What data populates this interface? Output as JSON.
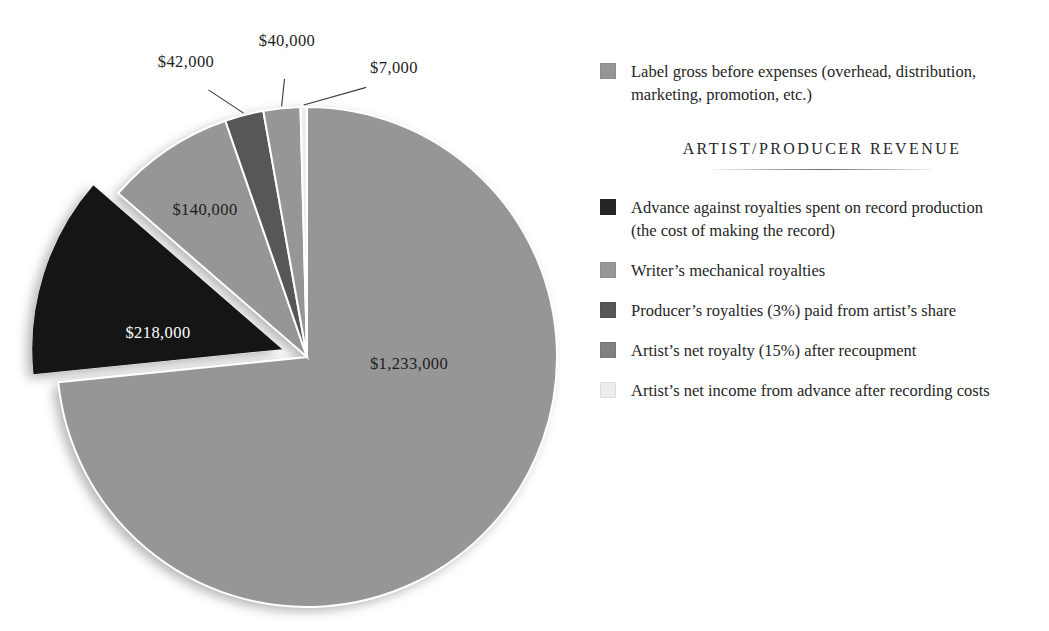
{
  "chart_data": {
    "type": "pie",
    "title": "",
    "currency": "$",
    "total": 1680000,
    "legend_position": "right",
    "categories": [
      "Label gross before expenses (overhead, distribution, marketing, promotion, etc.)",
      "Advance against royalties spent on record production (the cost of making the record)",
      "Writer's mechanical royalties",
      "Producer's royalties (3%) paid from artist's share",
      "Artist's net royalty (15%) after recoupment",
      "Artist's net income from advance after recording costs"
    ],
    "values": [
      1233000,
      218000,
      140000,
      42000,
      40000,
      7000
    ],
    "labels": [
      "$1,233,000",
      "$218,000",
      "$140,000",
      "$42,000",
      "$40,000",
      "$7,000"
    ],
    "colors": [
      "#969696",
      "#151515",
      "#969696",
      "#575757",
      "#969696",
      "#ededed"
    ]
  },
  "slices": [
    {
      "name": "label-gross",
      "value": 1233000,
      "label": "$1,233,000",
      "color": "#969696",
      "label_x": 409,
      "label_y": 364,
      "label_tone": "dark",
      "exploded": false,
      "leader": false
    },
    {
      "name": "advance-against-royalties",
      "value": 218000,
      "label": "$218,000",
      "color": "#151515",
      "label_x": 158,
      "label_y": 333,
      "label_tone": "light",
      "exploded": true,
      "leader": false
    },
    {
      "name": "writers-mechanical-royalties",
      "value": 140000,
      "label": "$140,000",
      "color": "#969696",
      "label_x": 205,
      "label_y": 210,
      "label_tone": "dark",
      "exploded": false,
      "leader": false
    },
    {
      "name": "producers-royalties",
      "value": 42000,
      "label": "$42,000",
      "color": "#575757",
      "label_x": 186,
      "label_y": 62,
      "label_tone": "dark",
      "exploded": false,
      "leader": true
    },
    {
      "name": "artists-net-royalty",
      "value": 40000,
      "label": "$40,000",
      "color": "#969696",
      "label_x": 287,
      "label_y": 41,
      "label_tone": "dark",
      "exploded": false,
      "leader": true
    },
    {
      "name": "artists-net-income-advance",
      "value": 7000,
      "label": "$7,000",
      "color": "#ededed",
      "label_x": 394,
      "label_y": 68,
      "label_tone": "dark",
      "exploded": false,
      "leader": true
    }
  ],
  "legend": {
    "top_entries": [
      {
        "name": "label-gross",
        "color": "#969696",
        "text": "Label gross before expenses (overhead, distribution, marketing, promotion, etc.)"
      }
    ],
    "section_header": "ARTIST/PRODUCER REVENUE",
    "entries": [
      {
        "name": "advance-against-royalties",
        "color": "#262626",
        "text": "Advance against royalties spent on record production (the cost of making the record)"
      },
      {
        "name": "writers-mechanical-royalties",
        "color": "#969696",
        "text": "Writer’s mechanical royalties"
      },
      {
        "name": "producers-royalties",
        "color": "#575757",
        "text": "Producer’s royalties (3%) paid from artist’s share"
      },
      {
        "name": "artists-net-royalty",
        "color": "#808080",
        "text": "Artist’s net royalty (15%) after recoupment"
      },
      {
        "name": "artists-net-income-advance",
        "color": "#ededed",
        "text": "Artist’s net income from advance after recording costs"
      }
    ]
  }
}
